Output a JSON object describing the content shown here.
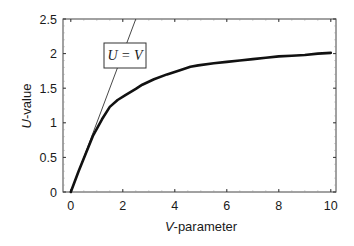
{
  "chart_data": {
    "type": "line",
    "title": "",
    "xlabel": "V-parameter",
    "xlabel_italic": "V",
    "xlabel_rest": "-parameter",
    "ylabel": "U-value",
    "ylabel_italic": "U",
    "ylabel_rest": "-value",
    "xlim": [
      -0.3,
      10.2
    ],
    "ylim": [
      0,
      2.5
    ],
    "xticks": [
      0,
      2,
      4,
      6,
      8,
      10
    ],
    "xtick_labels": [
      "0",
      "2",
      "4",
      "6",
      "8",
      "10"
    ],
    "yticks": [
      0,
      0.5,
      1,
      1.5,
      2,
      2.5
    ],
    "ytick_labels": [
      "0",
      "0.5",
      "1",
      "1.5",
      "2",
      "2.5"
    ],
    "grid": false,
    "legend": null,
    "series": [
      {
        "name": "U-value",
        "style": "thick solid black",
        "x": [
          0,
          0.3,
          0.6,
          0.86,
          1.2,
          1.5,
          1.8,
          2.1,
          2.5,
          2.75,
          3.2,
          3.7,
          4.2,
          4.6,
          4.9,
          5.5,
          6.0,
          6.5,
          7.0,
          7.5,
          8.0,
          8.5,
          9.0,
          9.5,
          10.0
        ],
        "y": [
          0,
          0.3,
          0.58,
          0.82,
          1.05,
          1.23,
          1.33,
          1.4,
          1.49,
          1.55,
          1.63,
          1.7,
          1.76,
          1.81,
          1.83,
          1.86,
          1.88,
          1.9,
          1.92,
          1.94,
          1.96,
          1.97,
          1.98,
          2.0,
          2.01
        ]
      },
      {
        "name": "U = V",
        "style": "thin solid black",
        "x": [
          0,
          2.5
        ],
        "y": [
          0,
          2.5
        ]
      }
    ],
    "annotations": [
      {
        "text": "U = V",
        "x": 1.7,
        "y": 2.1,
        "boxed": true
      }
    ]
  }
}
